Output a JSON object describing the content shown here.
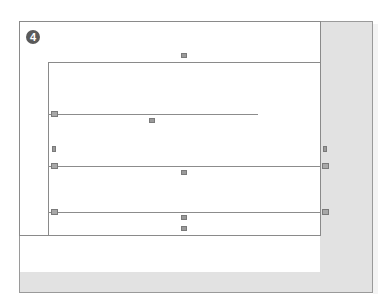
{
  "diagram": {
    "step_badge": "4",
    "colors": {
      "frame_border": "#8a8a8a",
      "shade": "#e2e2e2",
      "badge_fill": "#5a5a5a",
      "marker": "#9a9a9a"
    },
    "markers": [
      {
        "id": "top-center",
        "icon": "frame-handle-icon"
      },
      {
        "id": "rule1-left",
        "icon": "anchor-icon"
      },
      {
        "id": "rule1-center",
        "icon": "frame-handle-icon"
      },
      {
        "id": "left-mid",
        "icon": "frame-handle-icon"
      },
      {
        "id": "rule2-left",
        "icon": "anchor-icon"
      },
      {
        "id": "rule2-center",
        "icon": "frame-handle-icon"
      },
      {
        "id": "right-mid",
        "icon": "frame-handle-icon"
      },
      {
        "id": "rule2-right",
        "icon": "anchor-icon"
      },
      {
        "id": "rule3-left",
        "icon": "anchor-icon"
      },
      {
        "id": "rule3-center-a",
        "icon": "frame-handle-icon"
      },
      {
        "id": "rule3-center-b",
        "icon": "frame-handle-icon"
      },
      {
        "id": "rule3-right",
        "icon": "anchor-icon"
      }
    ]
  }
}
